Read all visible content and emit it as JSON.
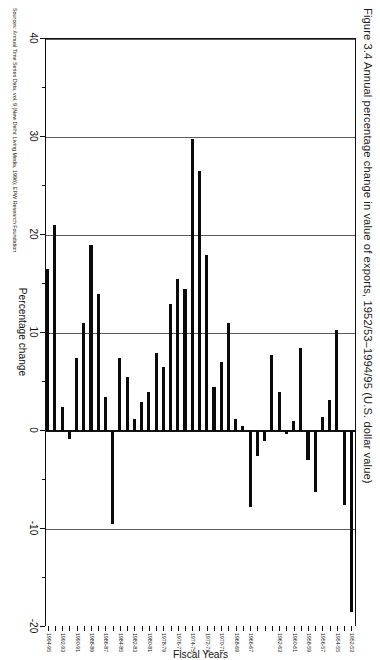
{
  "figure": {
    "title": "Figure 3.4  Annual percentage change in value of exports, 1952/53–1994/95 (U.S. dollar value)",
    "source_note": "Sources: Annual Time Series Data, vol. 9 (New Delhi: Living Media, 1996); EPW Research Foundation"
  },
  "chart_data": {
    "type": "bar",
    "orientation": "horizontal-rotated",
    "title": "Figure 3.4  Annual percentage change in value of exports, 1952/53–1994/95 (U.S. dollar value)",
    "xlabel": "Fiscal Years",
    "ylabel": "Percentage change",
    "ylim": [
      -20,
      40
    ],
    "grid": true,
    "legend": "none",
    "value_ticks": [
      40,
      30,
      20,
      10,
      0,
      -10,
      -20
    ],
    "value_tick_labels": [
      "40",
      "30",
      "20",
      "10",
      "0",
      "-10",
      "-20"
    ],
    "category_tick_labels": [
      "1952-53",
      "1954-55",
      "1956-57",
      "1958-59",
      "1960-61",
      "1962-63",
      "1966-67",
      "1968-69",
      "1970-71",
      "1972-73",
      "1974-75",
      "1976-77",
      "1978-79",
      "1980-81",
      "1982-83",
      "1984-85",
      "1986-87",
      "1988-89",
      "1990-91",
      "1992-93",
      "1994-95"
    ],
    "categories": [
      "1952-53",
      "1953-54",
      "1954-55",
      "1955-56",
      "1956-57",
      "1957-58",
      "1958-59",
      "1959-60",
      "1960-61",
      "1961-62",
      "1962-63",
      "1963-64",
      "1964-65",
      "1965-66",
      "1966-67",
      "1967-68",
      "1968-69",
      "1969-70",
      "1970-71",
      "1971-72",
      "1972-73",
      "1973-74",
      "1974-75",
      "1975-76",
      "1976-77",
      "1977-78",
      "1978-79",
      "1979-80",
      "1980-81",
      "1981-82",
      "1982-83",
      "1983-84",
      "1984-85",
      "1985-86",
      "1986-87",
      "1987-88",
      "1988-89",
      "1989-90",
      "1990-91",
      "1991-92",
      "1992-93",
      "1993-94",
      "1994-95"
    ],
    "values": [
      -18.5,
      -7.5,
      10.3,
      3.2,
      1.4,
      -6.2,
      -3.0,
      8.5,
      1.0,
      -0.3,
      4.0,
      7.8,
      -1.0,
      -2.5,
      -7.8,
      0.5,
      1.2,
      11.0,
      7.0,
      4.5,
      18.0,
      26.5,
      29.8,
      14.5,
      15.5,
      13.0,
      6.5,
      8.0,
      4.0,
      3.0,
      1.2,
      5.5,
      7.5,
      -9.5,
      3.5,
      14.0,
      19.0,
      11.0,
      7.5,
      -0.8,
      2.5,
      21.0,
      16.5
    ]
  }
}
